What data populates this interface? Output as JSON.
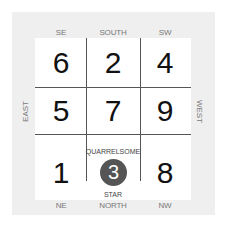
{
  "diagram": {
    "directions": {
      "top": [
        "SE",
        "SOUTH",
        "SW"
      ],
      "bottom": [
        "NE",
        "NORTH",
        "NW"
      ],
      "left": "EAST",
      "right": "WEST"
    },
    "grid": [
      [
        "6",
        "2",
        "4"
      ],
      [
        "5",
        "7",
        "9"
      ],
      [
        "1",
        "3",
        "8"
      ]
    ],
    "highlight": {
      "number": "3",
      "label_top": "QUARRELSOME",
      "label_bottom": "STAR",
      "color": "#555555"
    }
  }
}
